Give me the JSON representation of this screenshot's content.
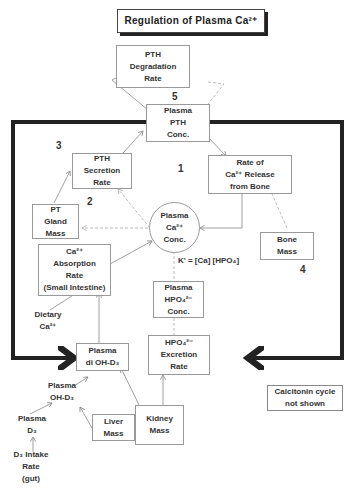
{
  "title": "Regulation of Plasma Ca²⁺",
  "nodes": {
    "pth_degradation": [
      "PTH",
      "Degradation",
      "Rate"
    ],
    "plasma_pth": [
      "Plasma",
      "PTH",
      "Conc."
    ],
    "pth_secretion": [
      "PTH",
      "Secretion",
      "Rate"
    ],
    "ca_release_bone": [
      "Rate of",
      "Ca²⁺ Release",
      "from Bone"
    ],
    "pt_gland_mass": [
      "PT",
      "Gland",
      "Mass"
    ],
    "plasma_ca": [
      "Plasma",
      "Ca²⁺",
      "Conc."
    ],
    "ca_absorption": [
      "Ca²⁺",
      "Absorption",
      "Rate",
      "(Small Intestine)"
    ],
    "bone_mass": [
      "Bone",
      "Mass"
    ],
    "plasma_hpo4": [
      "Plasma",
      "HPO₄²⁻",
      "Conc."
    ],
    "dietary_ca": [
      "Dietary",
      "Ca²⁺"
    ],
    "hpo4_excretion": [
      "HPO₄²⁻",
      "Excretion",
      "Rate"
    ],
    "plasma_diohd3": [
      "Plasma",
      "di OH-D₃"
    ],
    "plasma_ohd3": [
      "Plasma",
      "OH-D₃"
    ],
    "plasma_d3": [
      "Plasma",
      "D₃"
    ],
    "d3_intake": [
      "D₃ Intake",
      "Rate",
      "(gut)"
    ],
    "liver_mass": [
      "Liver",
      "Mass"
    ],
    "kidney_mass": [
      "Kidney",
      "Mass"
    ],
    "calcitonin_note": [
      "Calcitonin cycle",
      "not shown"
    ]
  },
  "formula": "K' = [Ca] [HPO₄]",
  "loop_numbers": {
    "n1": "1",
    "n2": "2",
    "n3": "3",
    "n4": "4",
    "n5": "5"
  },
  "colors": {
    "thick_loop": "#222222",
    "box_border": "#999999",
    "arrow": "#888888",
    "dashed": "#aaaaaa"
  }
}
